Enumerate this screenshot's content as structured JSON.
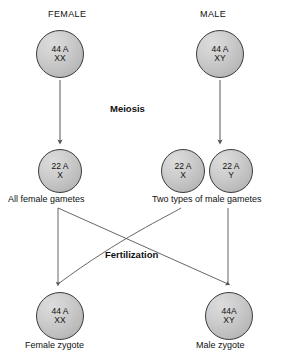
{
  "diagram": {
    "headers": {
      "female": "FEMALE",
      "male": "MALE"
    },
    "stages": {
      "meiosis": "Meiosis",
      "fertilization": "Fertilization"
    },
    "cells": {
      "female_parent": {
        "line1": "44 A",
        "line2": "XX"
      },
      "male_parent": {
        "line1": "44 A",
        "line2": "XY"
      },
      "female_gamete": {
        "line1": "22 A",
        "line2": "X"
      },
      "male_gamete_x": {
        "line1": "22 A",
        "line2": "X"
      },
      "male_gamete_y": {
        "line1": "22 A",
        "line2": "Y"
      },
      "female_zygote": {
        "line1": "44 A",
        "line2": "XX"
      },
      "male_zygote": {
        "line1": "44A",
        "line2": "XY"
      }
    },
    "captions": {
      "female_gametes": "All female gametes",
      "male_gametes": "Two types of male gametes",
      "female_zygote": "Female zygote",
      "male_zygote": "Male zygote"
    },
    "colors": {
      "cell_fill_light": "#dcdcdc",
      "cell_fill_dark": "#a8a8a8",
      "cell_stroke": "#3a3a3a",
      "connector": "#555555",
      "text": "#111111",
      "background": "#ffffff"
    }
  }
}
